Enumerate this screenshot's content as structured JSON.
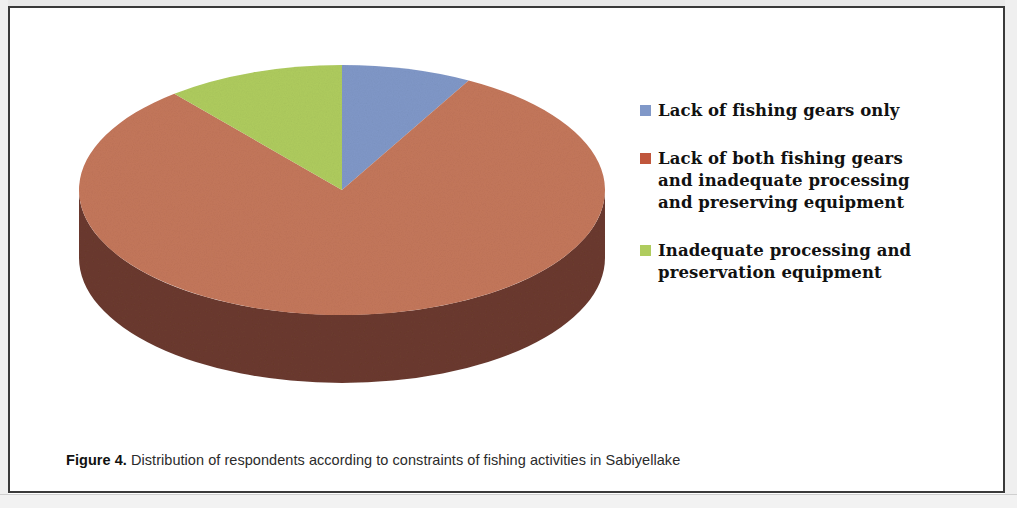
{
  "figure": {
    "caption_prefix": "Figure 4.",
    "caption_text": " Distribution of respondents according to constraints of fishing activities in Sabiyellake"
  },
  "legend": {
    "position": "right",
    "items": [
      {
        "label": "Lack of fishing gears only",
        "color": "#8098C8"
      },
      {
        "label": "Lack of both fishing gears\nand inadequate processing\nand preserving equipment",
        "color": "#C0563C"
      },
      {
        "label": "Inadequate processing and\npreservation equipment",
        "color": "#AFCC5E"
      }
    ]
  },
  "chart_data": {
    "type": "pie",
    "title": "",
    "subtitle": "",
    "xlabel": "",
    "ylabel": "",
    "three_d": true,
    "grid": false,
    "legend_position": "right",
    "start_angle_deg": 0,
    "direction": "clockwise",
    "categories": [
      "Lack of fishing gears only",
      "Lack of both fishing gears and inadequate processing and preserving equipment",
      "Inadequate processing and preservation equipment"
    ],
    "values": [
      8,
      81,
      11
    ],
    "units": "percent",
    "slice_colors": [
      "#8098C8",
      "#C4775B",
      "#AFCC5E"
    ],
    "slice_side_colors": [
      "#52659A",
      "#6B3A2E",
      "#7E9A38"
    ],
    "data_labels_shown": false,
    "annotations": []
  },
  "geometry": {
    "center_x": 332,
    "center_y": 182,
    "radius_x": 263,
    "radius_y": 125,
    "depth": 68
  }
}
